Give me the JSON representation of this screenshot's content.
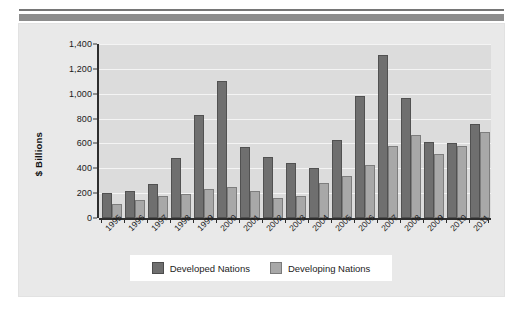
{
  "figure": {
    "ylabel": "$ Billions",
    "legend": {
      "developed_label": "Developed Nations",
      "developing_label": "Developing Nations",
      "developed_color": "#6f6f6f",
      "developing_color": "#a8a8a8"
    }
  },
  "chart_data": {
    "type": "bar",
    "title": "",
    "subtitle": "",
    "xlabel": "",
    "ylabel": "$ Billions",
    "ylim": [
      0,
      1400
    ],
    "yticks": [
      0,
      200,
      400,
      600,
      800,
      1000,
      1200,
      1400
    ],
    "ytick_labels": [
      "0",
      "200",
      "400",
      "600",
      "800",
      "1,000",
      "1,200",
      "1,400"
    ],
    "grid": true,
    "legend_position": "bottom",
    "categories": [
      "1995",
      "1996",
      "1997",
      "1998",
      "1999",
      "2000",
      "2001",
      "2002",
      "2003",
      "2004",
      "2005",
      "2006",
      "2007",
      "2008",
      "2009",
      "2010",
      "2011"
    ],
    "series": [
      {
        "name": "Developed Nations",
        "color": "#6f6f6f",
        "values": [
          205,
          220,
          275,
          485,
          830,
          1105,
          570,
          490,
          445,
          400,
          625,
          980,
          1310,
          965,
          610,
          605,
          755
        ]
      },
      {
        "name": "Developing Nations",
        "color": "#a8a8a8",
        "values": [
          115,
          145,
          180,
          195,
          235,
          250,
          220,
          165,
          175,
          280,
          335,
          430,
          580,
          665,
          515,
          580,
          690
        ]
      }
    ]
  }
}
